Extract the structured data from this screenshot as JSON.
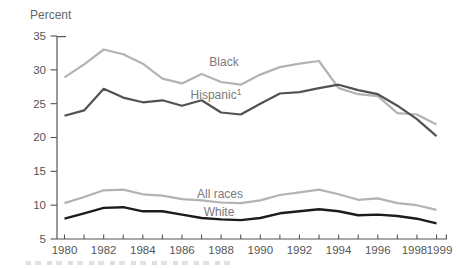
{
  "chart_data": {
    "type": "line",
    "title": "",
    "xlabel": "",
    "ylabel": "Percent",
    "ylim": [
      5,
      35
    ],
    "yticks": [
      5,
      10,
      15,
      20,
      25,
      30,
      35
    ],
    "grid": false,
    "legend_position": "inline-labels",
    "x": [
      1980,
      1981,
      1982,
      1983,
      1984,
      1985,
      1986,
      1987,
      1988,
      1989,
      1990,
      1991,
      1992,
      1993,
      1994,
      1995,
      1996,
      1997,
      1998,
      1999
    ],
    "xtick_labels": [
      "1980",
      "1982",
      "1984",
      "1986",
      "1988",
      "1990",
      "1992",
      "1994",
      "1996",
      "1998",
      "1999"
    ],
    "series": [
      {
        "name": "Black",
        "label": "Black",
        "footnote_marker": "",
        "color": "#b3b3b3",
        "values": [
          28.9,
          30.8,
          33.0,
          32.3,
          30.9,
          28.7,
          28.0,
          29.4,
          28.2,
          27.8,
          29.3,
          30.4,
          30.9,
          31.3,
          27.3,
          26.4,
          26.1,
          23.6,
          23.4,
          21.9
        ]
      },
      {
        "name": "Hispanic",
        "label": "Hispanic",
        "footnote_marker": "1",
        "color": "#525252",
        "values": [
          23.2,
          24.0,
          27.2,
          25.9,
          25.2,
          25.5,
          24.7,
          25.5,
          23.7,
          23.4,
          25.0,
          26.5,
          26.7,
          27.3,
          27.8,
          27.0,
          26.4,
          24.7,
          22.7,
          20.2
        ]
      },
      {
        "name": "All races",
        "label": "All races",
        "footnote_marker": "",
        "color": "#b3b3b3",
        "values": [
          10.3,
          11.2,
          12.2,
          12.3,
          11.6,
          11.4,
          10.9,
          10.7,
          10.4,
          10.3,
          10.7,
          11.5,
          11.9,
          12.3,
          11.6,
          10.8,
          11.0,
          10.3,
          10.0,
          9.3
        ]
      },
      {
        "name": "White",
        "label": "White",
        "footnote_marker": "",
        "color": "#1c1c1c",
        "values": [
          8.0,
          8.8,
          9.6,
          9.7,
          9.1,
          9.1,
          8.6,
          8.1,
          7.9,
          7.8,
          8.1,
          8.8,
          9.1,
          9.4,
          9.1,
          8.5,
          8.6,
          8.4,
          8.0,
          7.3
        ]
      }
    ],
    "colors": {
      "axis": "#555555",
      "tick_text": "#555555",
      "series_label_text": "#7a7a7a"
    }
  }
}
